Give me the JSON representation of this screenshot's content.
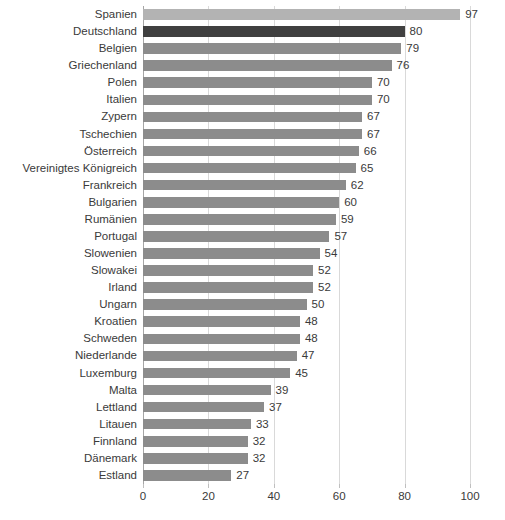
{
  "chart_data": {
    "type": "bar",
    "orientation": "horizontal",
    "title": "",
    "xlabel": "",
    "ylabel": "",
    "xlim": [
      0,
      100
    ],
    "xticks": [
      0,
      20,
      40,
      60,
      80,
      100
    ],
    "grid": true,
    "legend": "none",
    "highlight_category": "Deutschland",
    "colors": {
      "bar_default": "#8c8c8c",
      "bar_light": "#b3b3b3",
      "bar_highlight": "#404040",
      "gridline": "#d9d9d9",
      "axis": "#a6a6a6",
      "text": "#3a3a3a",
      "background": "#ffffff"
    },
    "categories": [
      "Spanien",
      "Deutschland",
      "Belgien",
      "Griechenland",
      "Polen",
      "Italien",
      "Zypern",
      "Tschechien",
      "Österreich",
      "Vereinigtes Königreich",
      "Frankreich",
      "Bulgarien",
      "Rumänien",
      "Portugal",
      "Slowenien",
      "Slowakei",
      "Irland",
      "Ungarn",
      "Kroatien",
      "Schweden",
      "Niederlande",
      "Luxemburg",
      "Malta",
      "Lettland",
      "Litauen",
      "Finnland",
      "Dänemark",
      "Estland"
    ],
    "values": [
      97,
      80,
      79,
      76,
      70,
      70,
      67,
      67,
      66,
      65,
      62,
      60,
      59,
      57,
      54,
      52,
      52,
      50,
      48,
      48,
      47,
      45,
      39,
      37,
      33,
      32,
      32,
      27
    ],
    "bar_styles": [
      "light",
      "dark",
      "default",
      "default",
      "default",
      "default",
      "default",
      "default",
      "default",
      "default",
      "default",
      "default",
      "default",
      "default",
      "default",
      "default",
      "default",
      "default",
      "default",
      "default",
      "default",
      "default",
      "default",
      "default",
      "default",
      "default",
      "default",
      "default"
    ],
    "value_labels": [
      "97",
      "80",
      "79",
      "76",
      "70",
      "70",
      "67",
      "67",
      "66",
      "65",
      "62",
      "60",
      "59",
      "57",
      "54",
      "52",
      "52",
      "50",
      "48",
      "48",
      "47",
      "45",
      "39",
      "37",
      "33",
      "32",
      "32",
      "27"
    ],
    "xtick_labels": [
      "0",
      "20",
      "40",
      "60",
      "80",
      "100"
    ]
  }
}
